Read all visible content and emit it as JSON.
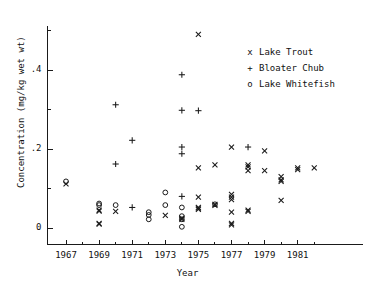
{
  "chart_data": {
    "type": "scatter",
    "title": "",
    "xlabel": "Year",
    "ylabel": "Concentration (mg/kg wet wt)",
    "xlim": [
      1966.0,
      1982.6
    ],
    "ylim": [
      -0.035,
      0.545
    ],
    "grid": false,
    "legend_position": "top-right",
    "x_ticks_major": [
      1967,
      1969,
      1971,
      1973,
      1975,
      1977,
      1979,
      1981
    ],
    "x_tick_labels": [
      "1967",
      "1969",
      "1971",
      "1973",
      "1975",
      "1977",
      "1979",
      "1981"
    ],
    "x_ticks_minor": [
      1968,
      1970,
      1972,
      1974,
      1976,
      1978,
      1980,
      1982
    ],
    "y_ticks_major": [
      0,
      0.2,
      0.4
    ],
    "y_tick_labels": [
      "0",
      ".2",
      ".4"
    ],
    "y_ticks_minor": [
      0.1,
      0.3,
      0.5
    ],
    "series": [
      {
        "name": "Lake Trout",
        "marker": "x",
        "points": [
          [
            1967,
            0.112
          ],
          [
            1969,
            0.045
          ],
          [
            1969,
            0.043
          ],
          [
            1969,
            0.012
          ],
          [
            1969,
            0.01
          ],
          [
            1970,
            0.042
          ],
          [
            1973,
            0.032
          ],
          [
            1974,
            0.025
          ],
          [
            1974,
            0.022
          ],
          [
            1975,
            0.49
          ],
          [
            1975,
            0.152
          ],
          [
            1975,
            0.078
          ],
          [
            1975,
            0.052
          ],
          [
            1975,
            0.05
          ],
          [
            1975,
            0.047
          ],
          [
            1976,
            0.16
          ],
          [
            1976,
            0.06
          ],
          [
            1976,
            0.057
          ],
          [
            1977,
            0.205
          ],
          [
            1977,
            0.085
          ],
          [
            1977,
            0.078
          ],
          [
            1977,
            0.072
          ],
          [
            1977,
            0.04
          ],
          [
            1977,
            0.012
          ],
          [
            1977,
            0.008
          ],
          [
            1978,
            0.16
          ],
          [
            1978,
            0.155
          ],
          [
            1978,
            0.145
          ],
          [
            1978,
            0.045
          ],
          [
            1978,
            0.042
          ],
          [
            1979,
            0.195
          ],
          [
            1979,
            0.145
          ],
          [
            1980,
            0.13
          ],
          [
            1980,
            0.122
          ],
          [
            1980,
            0.118
          ],
          [
            1980,
            0.07
          ],
          [
            1981,
            0.152
          ],
          [
            1981,
            0.148
          ],
          [
            1982,
            0.152
          ]
        ]
      },
      {
        "name": "Bloater Chub",
        "marker": "+",
        "points": [
          [
            1970,
            0.312
          ],
          [
            1970,
            0.162
          ],
          [
            1971,
            0.222
          ],
          [
            1971,
            0.052
          ],
          [
            1974,
            0.388
          ],
          [
            1974,
            0.298
          ],
          [
            1974,
            0.205
          ],
          [
            1974,
            0.188
          ],
          [
            1974,
            0.08
          ],
          [
            1975,
            0.297
          ],
          [
            1978,
            0.205
          ]
        ]
      },
      {
        "name": "Lake Whitefish",
        "marker": "o",
        "points": [
          [
            1967,
            0.118
          ],
          [
            1969,
            0.062
          ],
          [
            1969,
            0.058
          ],
          [
            1970,
            0.058
          ],
          [
            1972,
            0.04
          ],
          [
            1972,
            0.033
          ],
          [
            1972,
            0.022
          ],
          [
            1973,
            0.09
          ],
          [
            1973,
            0.058
          ],
          [
            1974,
            0.052
          ],
          [
            1974,
            0.03
          ],
          [
            1974,
            0.022
          ],
          [
            1974,
            0.003
          ],
          [
            1976,
            0.06
          ]
        ]
      }
    ]
  },
  "legend": {
    "entries": [
      {
        "symbol": "x",
        "label": "Lake Trout"
      },
      {
        "symbol": "+",
        "label": "Bloater Chub"
      },
      {
        "symbol": "o",
        "label": "Lake Whitefish"
      }
    ]
  }
}
